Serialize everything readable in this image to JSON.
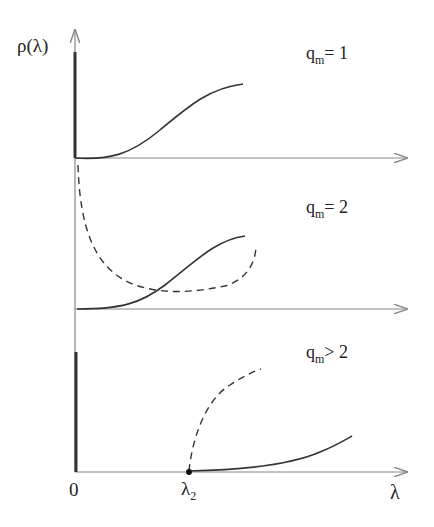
{
  "figure": {
    "y_axis_label": "ρ(λ)",
    "x_axis_label": "λ",
    "x_tick_zero": "0",
    "x_tick_lambda2": {
      "base": "λ",
      "sub": "2"
    },
    "colors": {
      "axis": "#888888",
      "curve": "#333333",
      "background": "#ffffff"
    }
  },
  "panels": [
    {
      "label": {
        "base": "q",
        "sub": "m",
        "rel": "= 1"
      },
      "solid_curve": "rises sigmoidally from 0",
      "dashed_curve": null
    },
    {
      "label": {
        "base": "q",
        "sub": "m",
        "rel": "= 2"
      },
      "solid_curve": "rises sigmoidally from 0",
      "dashed_curve": "decreasing from high at 0, minimum, then rising"
    },
    {
      "label": {
        "base": "q",
        "sub": "m",
        "rel": "> 2"
      },
      "solid_curve": "zero until λ2 then rising",
      "dashed_curve": "rising from λ2 concave"
    }
  ]
}
